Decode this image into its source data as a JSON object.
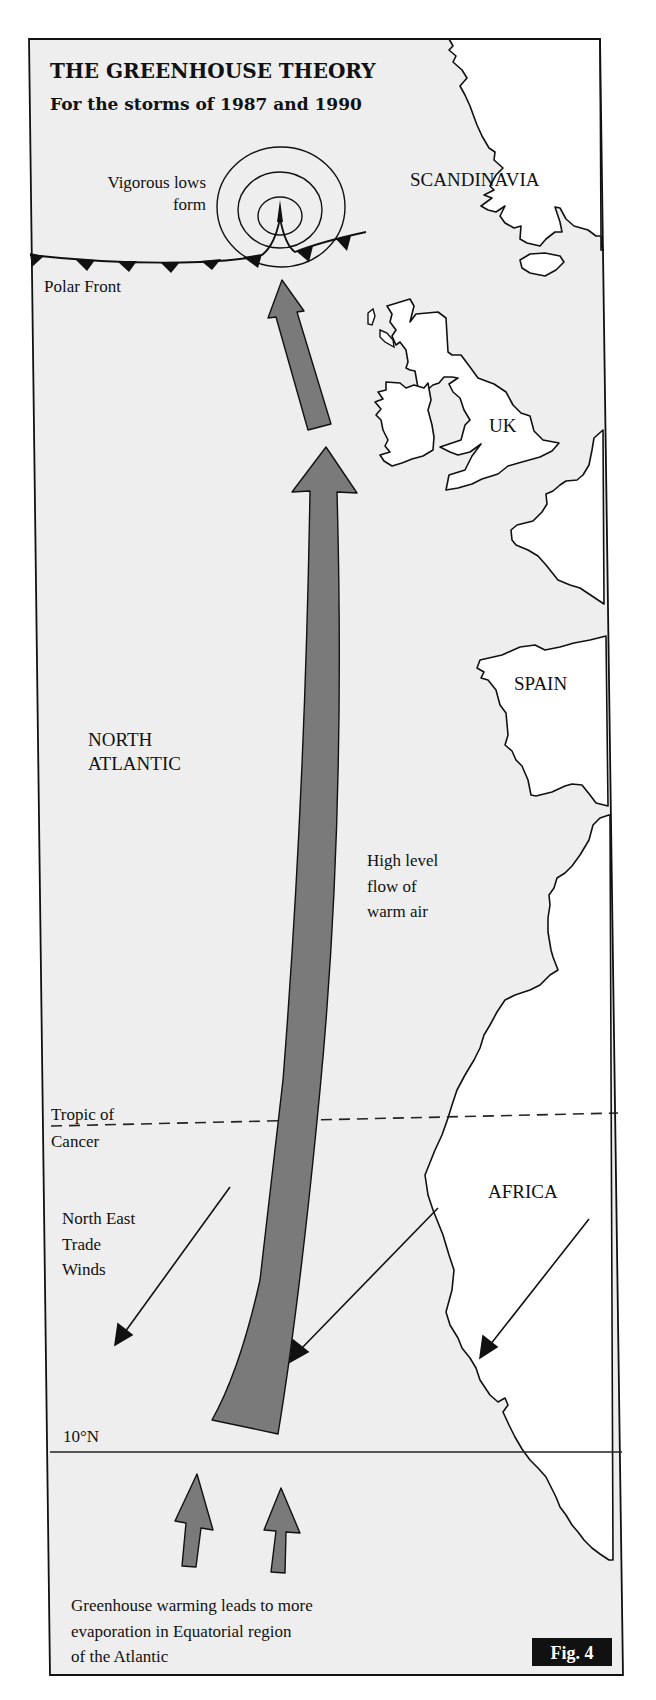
{
  "figure": {
    "title": "THE GREENHOUSE THEORY",
    "subtitle": "For the storms of 1987 and 1990",
    "badge": "Fig. 4"
  },
  "colors": {
    "sea": "#eeeeee",
    "land": "#ffffff",
    "arrow_fill": "#7a7a7a",
    "ink": "#111111",
    "badge_bg": "#111111",
    "badge_text": "#ffffff"
  },
  "labels": {
    "lows_line1": "Vigorous lows",
    "lows_line2": "form",
    "polar_front": "Polar Front",
    "scandinavia": "SCANDINAVIA",
    "uk": "UK",
    "spain": "SPAIN",
    "africa": "AFRICA",
    "ocean_line1": "NORTH",
    "ocean_line2": "ATLANTIC",
    "flow_line1": "High level",
    "flow_line2": "flow of",
    "flow_line3": "warm air",
    "tropic_line1": "Tropic of",
    "tropic_line2": "Cancer",
    "trade_line1": "North East",
    "trade_line2": "Trade",
    "trade_line3": "Winds",
    "latitude": "10°N",
    "caption_line1": "Greenhouse warming leads to more",
    "caption_line2": "evaporation in Equatorial region",
    "caption_line3": "of the Atlantic"
  },
  "legend_items": [
    {
      "symbol": "cold-front-triangles",
      "meaning": "Polar Front"
    },
    {
      "symbol": "concentric-circles",
      "meaning": "Vigorous lows form"
    },
    {
      "symbol": "grey-broad-arrow",
      "meaning": "High level flow of warm air"
    },
    {
      "symbol": "thin-arrow",
      "meaning": "North East Trade Winds"
    },
    {
      "symbol": "dashed-line",
      "meaning": "Tropic of Cancer"
    },
    {
      "symbol": "solid-line",
      "meaning": "10°N"
    }
  ]
}
